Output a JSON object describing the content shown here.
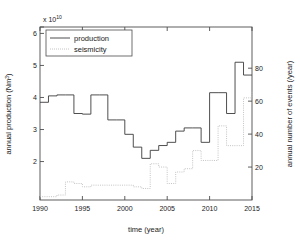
{
  "figure": {
    "background_color": "#ffffff",
    "axes_color": "#4d4d4d",
    "production_color": "#3b3b3b",
    "seismicity_color": "#bdbdbd"
  },
  "axes": {
    "x": {
      "label": "time (year)",
      "ticks": [
        "1990",
        "1995",
        "2000",
        "2005",
        "2010",
        "2015"
      ],
      "min": 1990,
      "max": 2015
    },
    "y_left": {
      "label_main": "annual production (Nm",
      "label_sup": "3",
      "label_close": ")",
      "exponent_prefix": "x 10",
      "exponent_value": "10",
      "ticks": [
        "2",
        "3",
        "4",
        "5",
        "6"
      ],
      "min": 0.8,
      "max": 6.2
    },
    "y_right": {
      "label": "annual number of events (/year)",
      "ticks": [
        "20",
        "40",
        "60",
        "80"
      ],
      "min": 0,
      "max": 105
    }
  },
  "legend": {
    "production_label": "production",
    "seismicity_label": "seismicity"
  },
  "chart_data": {
    "type": "line",
    "title": "",
    "xlabel": "time (year)",
    "ylabel": "annual production (Nm3)",
    "ylabel_right": "annual number of events (/year)",
    "y_exponent": "1e10",
    "xlim": [
      1990,
      2015
    ],
    "ylim_left": [
      0.8,
      6.2
    ],
    "ylim_right": [
      0,
      105
    ],
    "grid": false,
    "legend_position": "upper left",
    "drawstyle": "steps-post",
    "x": [
      1990,
      1991,
      1992,
      1993,
      1994,
      1995,
      1996,
      1997,
      1998,
      1999,
      2000,
      2001,
      2002,
      2003,
      2004,
      2005,
      2006,
      2007,
      2008,
      2009,
      2010,
      2011,
      2012,
      2013,
      2014,
      2015
    ],
    "series": [
      {
        "name": "production",
        "axis": "left",
        "style": "solid",
        "units": "1e10 Nm3",
        "values": [
          3.85,
          4.05,
          4.08,
          4.08,
          3.5,
          3.48,
          4.08,
          4.08,
          3.3,
          3.3,
          2.85,
          2.45,
          2.1,
          2.35,
          2.5,
          2.6,
          2.95,
          3.05,
          3.05,
          2.6,
          4.15,
          4.15,
          3.5,
          5.1,
          4.7,
          4.7
        ]
      },
      {
        "name": "seismicity",
        "axis": "right",
        "style": "dotted",
        "units": "events/year",
        "values": [
          2,
          2,
          3,
          11,
          10,
          8,
          9,
          9,
          9,
          9,
          9,
          8,
          7,
          22,
          20,
          10,
          17,
          19,
          30,
          24,
          24,
          45,
          33,
          33,
          62,
          66
        ]
      }
    ]
  }
}
